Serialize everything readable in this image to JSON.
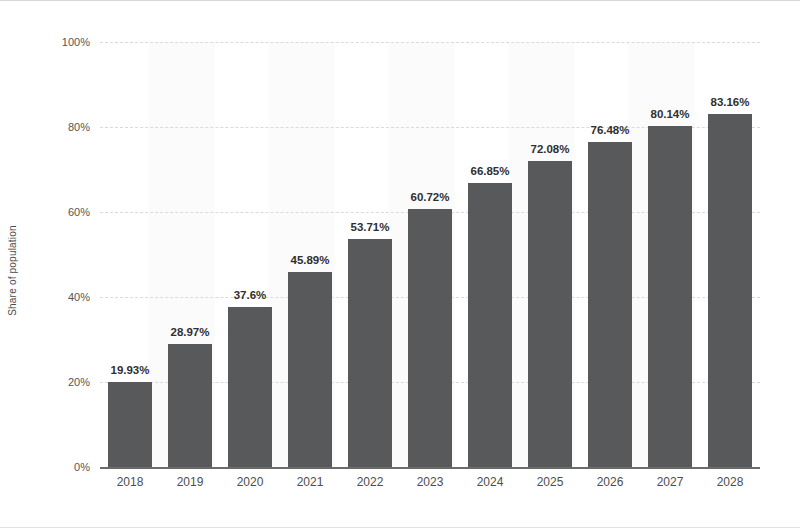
{
  "chart_data": {
    "type": "bar",
    "title": "",
    "xlabel": "",
    "ylabel": "Share of population",
    "categories": [
      "2018",
      "2019",
      "2020",
      "2021",
      "2022",
      "2023",
      "2024",
      "2025",
      "2026",
      "2027",
      "2028"
    ],
    "values": [
      19.93,
      28.97,
      37.6,
      45.89,
      53.71,
      60.72,
      66.85,
      72.08,
      76.48,
      80.14,
      83.16
    ],
    "data_labels": [
      "19.93%",
      "28.97%",
      "37.6%",
      "45.89%",
      "53.71%",
      "60.72%",
      "66.85%",
      "72.08%",
      "76.48%",
      "80.14%",
      "83.16%"
    ],
    "ylim": [
      0,
      100
    ],
    "y_ticks": [
      0,
      20,
      40,
      60,
      80,
      100
    ],
    "y_tick_labels": [
      "0%",
      "20%",
      "40%",
      "60%",
      "80%",
      "100%"
    ],
    "grid": true,
    "legend": false,
    "bar_color": "#58595b",
    "gridline_color": "#dadada",
    "axis_color": "#6b6b6b",
    "background_color": "#ffffff"
  }
}
